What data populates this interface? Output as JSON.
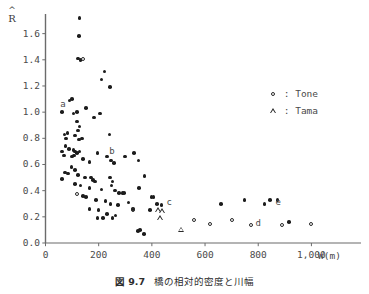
{
  "caption": {
    "figure_number": "図 9.7",
    "text": "橋の相対的密度と川幅"
  },
  "legend": {
    "position": "top-right",
    "entries": [
      {
        "symbol": "open-circle",
        "separator": ":",
        "label": "Tone"
      },
      {
        "symbol": "open-triangle",
        "separator": ":",
        "label": "Tama"
      }
    ]
  },
  "chart_data": {
    "type": "scatter",
    "title": "",
    "xlabel": "W(m)",
    "ylabel": "R̂",
    "xlim": [
      0,
      1100
    ],
    "ylim": [
      0.0,
      1.75
    ],
    "grid": false,
    "xticks": [
      0,
      200,
      400,
      600,
      800,
      1000
    ],
    "xtick_labels": [
      "0",
      "200",
      "400",
      "600",
      "800",
      "1,000"
    ],
    "yticks": [
      0.0,
      0.2,
      0.4,
      0.6,
      0.8,
      1.0,
      1.2,
      1.4,
      1.6
    ],
    "ytick_labels": [
      "0.0",
      "0.2",
      "0.4",
      "0.6",
      "0.8",
      "1.0",
      "1.2",
      "1.4",
      "1.6"
    ],
    "annotations": [
      {
        "text": "a",
        "x": 55,
        "y": 1.055
      },
      {
        "text": "b",
        "x": 240,
        "y": 0.695
      },
      {
        "text": "c",
        "x": 455,
        "y": 0.305
      },
      {
        "text": "d",
        "x": 790,
        "y": 0.145
      },
      {
        "text": "e",
        "x": 865,
        "y": 0.305
      }
    ],
    "series": [
      {
        "name": "filled",
        "marker": "filled-circle",
        "color": "#1c1c1c",
        "points": [
          [
            128,
            1.72
          ],
          [
            125,
            1.58
          ],
          [
            122,
            1.41
          ],
          [
            132,
            1.4
          ],
          [
            222,
            1.31
          ],
          [
            210,
            1.25
          ],
          [
            243,
            1.19
          ],
          [
            90,
            1.09
          ],
          [
            100,
            1.1
          ],
          [
            62,
            1.0
          ],
          [
            105,
            0.99
          ],
          [
            118,
            1.0
          ],
          [
            152,
            1.03
          ],
          [
            183,
            0.96
          ],
          [
            205,
            0.99
          ],
          [
            118,
            0.93
          ],
          [
            128,
            0.89
          ],
          [
            122,
            0.86
          ],
          [
            72,
            0.83
          ],
          [
            82,
            0.84
          ],
          [
            78,
            0.8
          ],
          [
            112,
            0.82
          ],
          [
            125,
            0.79
          ],
          [
            138,
            0.8
          ],
          [
            240,
            0.83
          ],
          [
            75,
            0.74
          ],
          [
            88,
            0.72
          ],
          [
            105,
            0.71
          ],
          [
            112,
            0.7
          ],
          [
            118,
            0.69
          ],
          [
            128,
            0.7
          ],
          [
            63,
            0.7
          ],
          [
            70,
            0.67
          ],
          [
            100,
            0.66
          ],
          [
            108,
            0.67
          ],
          [
            140,
            0.64
          ],
          [
            165,
            0.62
          ],
          [
            196,
            0.69
          ],
          [
            232,
            0.66
          ],
          [
            247,
            0.63
          ],
          [
            258,
            0.61
          ],
          [
            300,
            0.66
          ],
          [
            332,
            0.69
          ],
          [
            98,
            0.58
          ],
          [
            110,
            0.56
          ],
          [
            74,
            0.54
          ],
          [
            84,
            0.53
          ],
          [
            122,
            0.52
          ],
          [
            148,
            0.5
          ],
          [
            172,
            0.5
          ],
          [
            178,
            0.48
          ],
          [
            186,
            0.47
          ],
          [
            243,
            0.5
          ],
          [
            252,
            0.47
          ],
          [
            248,
            0.44
          ],
          [
            350,
            0.63
          ],
          [
            372,
            0.51
          ],
          [
            62,
            0.49
          ],
          [
            112,
            0.45
          ],
          [
            132,
            0.44
          ],
          [
            165,
            0.42
          ],
          [
            210,
            0.41
          ],
          [
            262,
            0.4
          ],
          [
            276,
            0.38
          ],
          [
            290,
            0.38
          ],
          [
            296,
            0.38
          ],
          [
            352,
            0.42
          ],
          [
            140,
            0.36
          ],
          [
            152,
            0.35
          ],
          [
            190,
            0.33
          ],
          [
            226,
            0.32
          ],
          [
            245,
            0.3
          ],
          [
            272,
            0.29
          ],
          [
            312,
            0.31
          ],
          [
            398,
            0.35
          ],
          [
            406,
            0.35
          ],
          [
            420,
            0.3
          ],
          [
            436,
            0.29
          ],
          [
            166,
            0.26
          ],
          [
            200,
            0.25
          ],
          [
            232,
            0.22
          ],
          [
            264,
            0.21
          ],
          [
            330,
            0.26
          ],
          [
            392,
            0.25
          ],
          [
            196,
            0.19
          ],
          [
            216,
            0.19
          ],
          [
            252,
            0.19
          ],
          [
            348,
            0.09
          ],
          [
            356,
            0.1
          ],
          [
            370,
            0.07
          ],
          [
            660,
            0.3
          ],
          [
            748,
            0.33
          ],
          [
            824,
            0.3
          ],
          [
            844,
            0.33
          ],
          [
            872,
            0.33
          ],
          [
            916,
            0.16
          ]
        ]
      },
      {
        "name": "Tone",
        "marker": "open-circle",
        "color": "#2a2a2a",
        "points": [
          [
            140,
            1.405
          ],
          [
            120,
            0.375
          ],
          [
            330,
            0.255
          ],
          [
            560,
            0.175
          ],
          [
            620,
            0.145
          ],
          [
            700,
            0.175
          ],
          [
            772,
            0.135
          ],
          [
            890,
            0.135
          ],
          [
            1000,
            0.145
          ]
        ]
      },
      {
        "name": "Tama",
        "marker": "open-triangle",
        "color": "#2a2a2a",
        "points": [
          [
            424,
            0.255
          ],
          [
            438,
            0.245
          ],
          [
            432,
            0.195
          ],
          [
            508,
            0.105
          ]
        ]
      }
    ]
  }
}
